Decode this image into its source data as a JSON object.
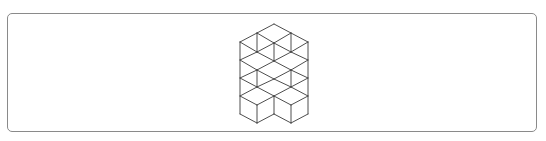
{
  "figure": {
    "stroke_color": "#3a3a3a",
    "frame_color": "#8a8a8a",
    "background_color": "#ffffff",
    "edges": [
      [
        274,
        24,
        257,
        33
      ],
      [
        274,
        24,
        291,
        33
      ],
      [
        257,
        33,
        274,
        43
      ],
      [
        291,
        33,
        274,
        43
      ],
      [
        257,
        33,
        240,
        42
      ],
      [
        291,
        33,
        308,
        42
      ],
      [
        240,
        42,
        257,
        52
      ],
      [
        274,
        43,
        257,
        52
      ],
      [
        274,
        43,
        291,
        52
      ],
      [
        308,
        42,
        291,
        52
      ],
      [
        257,
        52,
        240,
        60
      ],
      [
        257,
        52,
        274,
        61
      ],
      [
        291,
        52,
        274,
        61
      ],
      [
        291,
        52,
        308,
        60
      ],
      [
        240,
        60,
        257,
        70
      ],
      [
        274,
        61,
        257,
        70
      ],
      [
        274,
        61,
        291,
        70
      ],
      [
        308,
        60,
        291,
        70
      ],
      [
        257,
        70,
        240,
        78
      ],
      [
        257,
        70,
        274,
        79
      ],
      [
        291,
        70,
        274,
        79
      ],
      [
        291,
        70,
        308,
        78
      ],
      [
        240,
        78,
        257,
        87
      ],
      [
        274,
        79,
        257,
        87
      ],
      [
        274,
        79,
        291,
        87
      ],
      [
        308,
        78,
        291,
        87
      ],
      [
        257,
        87,
        240,
        96
      ],
      [
        257,
        87,
        274,
        96
      ],
      [
        291,
        87,
        274,
        96
      ],
      [
        291,
        87,
        308,
        96
      ],
      [
        240,
        96,
        257,
        105
      ],
      [
        274,
        96,
        257,
        105
      ],
      [
        274,
        96,
        291,
        105
      ],
      [
        308,
        96,
        291,
        105
      ],
      [
        240,
        114,
        257,
        123
      ],
      [
        257,
        123,
        274,
        114
      ],
      [
        274,
        114,
        291,
        123
      ],
      [
        291,
        123,
        308,
        114
      ],
      [
        257,
        33,
        257,
        52
      ],
      [
        291,
        33,
        291,
        52
      ],
      [
        274,
        43,
        274,
        61
      ],
      [
        240,
        42,
        240,
        114
      ],
      [
        308,
        42,
        308,
        114
      ],
      [
        257,
        70,
        257,
        87
      ],
      [
        291,
        70,
        291,
        87
      ],
      [
        257,
        105,
        257,
        123
      ],
      [
        291,
        105,
        291,
        123
      ],
      [
        274,
        96,
        274,
        114
      ]
    ]
  }
}
